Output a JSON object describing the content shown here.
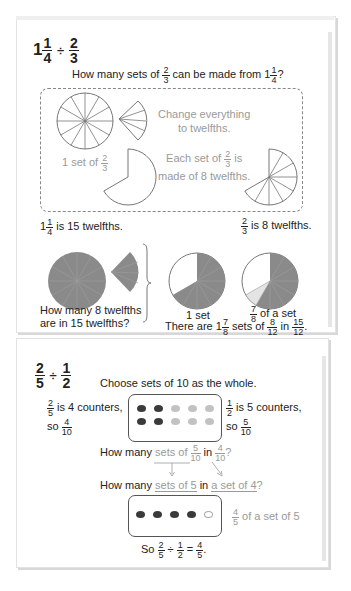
{
  "section1": {
    "title": {
      "whole": "1",
      "num1": "1",
      "den1": "4",
      "op": "÷",
      "num2": "2",
      "den2": "3"
    },
    "question": {
      "pre": "How many sets of",
      "fnum": "2",
      "fden": "3",
      "mid": "can be made from",
      "whole": "1",
      "num": "1",
      "den": "4",
      "post": "?"
    },
    "dashed_box": {
      "line1": "Change everything",
      "line2": "to twelfths.",
      "set_label_pre": "1 set of",
      "set_num": "2",
      "set_den": "3",
      "each_pre": "Each set of",
      "each_num": "2",
      "each_den": "3",
      "each_post": "is",
      "each_line2": "made of 8 twelfths."
    },
    "left_caption": {
      "whole": "1",
      "num": "1",
      "den": "4",
      "post": "is 15 twelfths."
    },
    "right_caption": {
      "num": "2",
      "den": "3",
      "post": "is 8 twelfths."
    },
    "question2_line1": "How many 8 twelfths",
    "question2_line2": "are in 15 twelfths?",
    "label_1set": "1 set",
    "label_frac": {
      "num": "7",
      "den": "8",
      "post": "of a set"
    },
    "answer": {
      "pre": "There are",
      "whole": "1",
      "num": "7",
      "den": "8",
      "mid": "sets of",
      "n2": "8",
      "d2": "12",
      "mid2": "in",
      "n3": "15",
      "d3": "12",
      "post": "."
    }
  },
  "section2": {
    "title": {
      "num1": "2",
      "den1": "5",
      "op": "÷",
      "num2": "1",
      "den2": "2"
    },
    "subtitle": "Choose sets of 10 as the whole.",
    "left_note": {
      "num": "2",
      "den": "5",
      "text": "is 4 counters,",
      "so": "so",
      "n2": "4",
      "d2": "10"
    },
    "right_note": {
      "num": "1",
      "den": "2",
      "text": "is 5 counters,",
      "so": "so",
      "n2": "5",
      "d2": "10"
    },
    "q1": {
      "pre": "How many",
      "sets": "sets of",
      "n1": "5",
      "d1": "10",
      "in": "in",
      "n2": "4",
      "d2": "10",
      "post": "?"
    },
    "q2": {
      "pre": "How many",
      "sets": "sets of 5",
      "in": "in",
      "aset": "a set of 4",
      "post": "?"
    },
    "set_note": {
      "num": "4",
      "den": "5",
      "text": "of a set of 5"
    },
    "conclusion": {
      "pre": "So",
      "n1": "2",
      "d1": "5",
      "op": "÷",
      "n2": "1",
      "d2": "2",
      "eq": "=",
      "n3": "4",
      "d3": "5",
      "post": "."
    }
  },
  "colors": {
    "fill": "#8a8a8a",
    "light": "#e4e4e4",
    "counter_dark": "#3a3a3a",
    "counter_light": "#c2c2c2",
    "text_gray": "#9a9a9a"
  }
}
